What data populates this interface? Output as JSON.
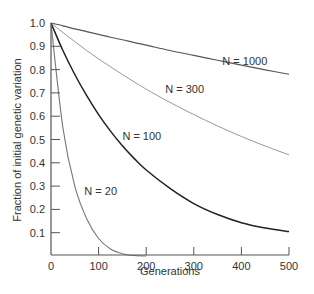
{
  "chart_data": {
    "type": "line",
    "title": "",
    "xlabel": "Generations",
    "ylabel": "Fraction of initial genetic variation",
    "xlim": [
      0,
      500
    ],
    "ylim": [
      0,
      1.0
    ],
    "x_ticks": [
      0,
      100,
      200,
      300,
      400,
      500
    ],
    "y_ticks": [
      0.1,
      0.2,
      0.3,
      0.4,
      0.5,
      0.6,
      0.7,
      0.8,
      0.9,
      1.0
    ],
    "grid": false,
    "legend": "inline labels",
    "x": [
      0,
      25,
      50,
      75,
      100,
      125,
      150,
      175,
      200,
      250,
      300,
      350,
      400,
      450,
      500
    ],
    "series": [
      {
        "name": "N = 1000",
        "color": "#555555",
        "width": 1.2,
        "values": [
          1.0,
          0.988,
          0.975,
          0.963,
          0.951,
          0.939,
          0.928,
          0.916,
          0.905,
          0.882,
          0.861,
          0.84,
          0.819,
          0.799,
          0.78
        ]
      },
      {
        "name": "N = 300",
        "color": "#999999",
        "width": 1.0,
        "values": [
          1.0,
          0.959,
          0.92,
          0.882,
          0.846,
          0.812,
          0.779,
          0.747,
          0.716,
          0.659,
          0.607,
          0.558,
          0.513,
          0.472,
          0.434
        ]
      },
      {
        "name": "N = 100",
        "color": "#222222",
        "width": 1.5,
        "values": [
          1.0,
          0.882,
          0.779,
          0.688,
          0.607,
          0.536,
          0.473,
          0.418,
          0.369,
          0.29,
          0.225,
          0.178,
          0.143,
          0.12,
          0.105
        ]
      },
      {
        "name": "N = 20",
        "color": "#777777",
        "width": 1.1,
        "values": [
          1.0,
          0.55,
          0.3,
          0.16,
          0.075,
          0.03,
          0.01,
          0.002,
          0.0,
          null,
          null,
          null,
          null,
          null,
          null
        ]
      }
    ],
    "annotations": [
      {
        "text": "N = 1000",
        "x": 360,
        "y": 0.82
      },
      {
        "text": "N = 300",
        "x": 240,
        "y": 0.7
      },
      {
        "text": "N = 100",
        "x": 150,
        "y": 0.5
      },
      {
        "text": "N = 20",
        "x": 70,
        "y": 0.26
      }
    ]
  }
}
